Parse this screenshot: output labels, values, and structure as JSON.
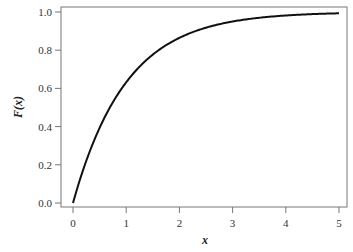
{
  "chart_data": {
    "type": "line",
    "title": "",
    "xlabel": "x",
    "ylabel": "F(x)",
    "xlim": [
      0,
      5
    ],
    "ylim": [
      0,
      1
    ],
    "x_ticks": [
      "0",
      "1",
      "2",
      "3",
      "4",
      "5"
    ],
    "y_ticks": [
      "0.0",
      "0.2",
      "0.4",
      "0.6",
      "0.8",
      "1.0"
    ],
    "grid": false,
    "legend": null,
    "series": [
      {
        "name": "F(x) = 1 - exp(-x)",
        "x": [
          0,
          0.25,
          0.5,
          0.75,
          1,
          1.5,
          2,
          2.5,
          3,
          3.5,
          4,
          4.5,
          5
        ],
        "values": [
          0.0,
          0.221,
          0.393,
          0.528,
          0.632,
          0.777,
          0.865,
          0.918,
          0.95,
          0.97,
          0.982,
          0.989,
          0.993
        ]
      }
    ]
  }
}
